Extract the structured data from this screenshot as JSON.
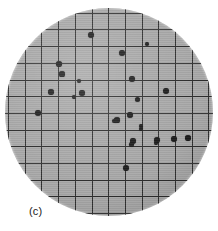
{
  "figure": {
    "panel_label": "(c)",
    "width": 218,
    "height": 231,
    "background_color": "#ffffff"
  },
  "dish": {
    "name": "circular membrane filter",
    "center_x": 109,
    "center_y": 112,
    "radius": 104,
    "surface_color": "#a8a8a8",
    "grid_color": "#2e2e2e",
    "colony_color": "#1a1a1a"
  },
  "grid": {
    "spacing_px": 16.7,
    "origin_x": 8,
    "origin_y": 12.7,
    "vertical_lines": 14,
    "horizontal_lines": 13,
    "line_width_px": 1
  },
  "colonies": {
    "count": 27,
    "points": [
      {
        "x": 91,
        "y": 35,
        "r": 3.2
      },
      {
        "x": 147,
        "y": 44,
        "r": 2.4
      },
      {
        "x": 122,
        "y": 53,
        "r": 3.1
      },
      {
        "x": 59,
        "y": 64,
        "r": 2.8
      },
      {
        "x": 62,
        "y": 74,
        "r": 2.6
      },
      {
        "x": 79,
        "y": 81,
        "r": 2.4
      },
      {
        "x": 132,
        "y": 79,
        "r": 2.9
      },
      {
        "x": 51,
        "y": 92,
        "r": 2.8
      },
      {
        "x": 82,
        "y": 93,
        "r": 2.7
      },
      {
        "x": 74,
        "y": 97,
        "r": 1.7
      },
      {
        "x": 137,
        "y": 99,
        "r": 2.5
      },
      {
        "x": 166,
        "y": 91,
        "r": 3.0
      },
      {
        "x": 38,
        "y": 113,
        "r": 3.0
      },
      {
        "x": 130,
        "y": 115,
        "r": 2.9
      },
      {
        "x": 117,
        "y": 120,
        "r": 2.6
      },
      {
        "x": 114,
        "y": 121,
        "r": 2.2
      },
      {
        "x": 141,
        "y": 126,
        "r": 2.2
      },
      {
        "x": 141,
        "y": 129,
        "r": 2.0
      },
      {
        "x": 133,
        "y": 141,
        "r": 2.8
      },
      {
        "x": 157,
        "y": 140,
        "r": 3.0
      },
      {
        "x": 174,
        "y": 139,
        "r": 2.9
      },
      {
        "x": 131,
        "y": 144,
        "r": 2.5
      },
      {
        "x": 126,
        "y": 168,
        "r": 3.0
      },
      {
        "x": 156,
        "y": 143,
        "r": 2.4
      },
      {
        "x": 188,
        "y": 138,
        "r": 2.8
      },
      {
        "x": 130,
        "y": 115,
        "r": 2.0
      },
      {
        "x": 116,
        "y": 121,
        "r": 2.0
      }
    ]
  }
}
